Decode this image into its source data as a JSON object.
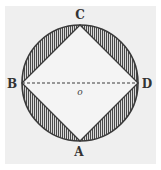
{
  "diagram": {
    "background_color": "#efefef",
    "stroke_color": "#3a3a3a",
    "hatch_color": "#555555",
    "circle": {
      "cx": 80,
      "cy": 83,
      "r": 58
    },
    "points": {
      "C": {
        "label": "C",
        "x": 80,
        "y": 25
      },
      "B": {
        "label": "B",
        "x": 22,
        "y": 83
      },
      "D": {
        "label": "D",
        "x": 138,
        "y": 83
      },
      "A": {
        "label": "A",
        "x": 80,
        "y": 141
      }
    },
    "center_label": "o",
    "segments": [
      {
        "from": "B",
        "to": "C",
        "style": "solid"
      },
      {
        "from": "C",
        "to": "D",
        "style": "solid"
      },
      {
        "from": "D",
        "to": "A",
        "style": "solid"
      },
      {
        "from": "A",
        "to": "B",
        "style": "solid"
      },
      {
        "from": "B",
        "to": "D",
        "style": "dashed"
      }
    ],
    "shaded_regions": [
      "segment BC",
      "segment CD",
      "segment DA",
      "segment AB"
    ],
    "hatch": "vertical lines"
  }
}
